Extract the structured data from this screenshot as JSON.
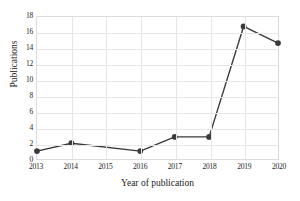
{
  "chart_data": {
    "type": "line",
    "title": "",
    "xlabel": "Year of publication",
    "ylabel": "Publications",
    "categories": [
      "2013",
      "2014",
      "2015",
      "2016",
      "2017",
      "2018",
      "2019",
      "2020"
    ],
    "x": [
      2013,
      2014,
      2015,
      2016,
      2017,
      2018,
      2019,
      2020
    ],
    "values": [
      1,
      2,
      null,
      1,
      2.8,
      2.8,
      16.8,
      14.7
    ],
    "markers": [
      true,
      true,
      false,
      true,
      true,
      true,
      true,
      true
    ],
    "xlim": [
      2013,
      2020
    ],
    "ylim": [
      0,
      18
    ],
    "yticks": [
      0,
      2,
      4,
      6,
      8,
      10,
      12,
      14,
      16,
      18
    ],
    "ytick_labels": [
      "0",
      "2",
      "4",
      "6",
      "8",
      "10",
      "12",
      "14",
      "16",
      "18"
    ],
    "xticks": [
      2013,
      2014,
      2015,
      2016,
      2017,
      2018,
      2019,
      2020
    ],
    "xtick_labels": [
      "2013",
      "2014",
      "2015",
      "2016",
      "2017",
      "2018",
      "2019",
      "2020"
    ],
    "grid": true,
    "grid_axes": "both",
    "legend": false,
    "legend_position": "none",
    "series": [
      {
        "name": "Publications",
        "values": [
          1,
          2,
          null,
          1,
          2.8,
          2.8,
          16.8,
          14.7
        ],
        "color": "#3a3a3a",
        "marker": "circle"
      }
    ]
  },
  "colors": {
    "series_line": "#3a3a3a",
    "marker_fill": "#3a3a3a",
    "gridline": "#e6e6e6",
    "plot_border": "#dcdcdc",
    "background": "#ffffff",
    "text": "#1a1a1a"
  }
}
